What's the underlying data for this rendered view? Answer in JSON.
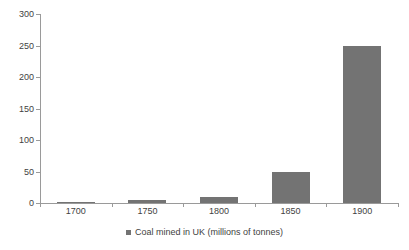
{
  "chart_data": {
    "type": "bar",
    "title": "",
    "xlabel": "",
    "ylabel": "",
    "categories": [
      "1700",
      "1750",
      "1800",
      "1850",
      "1900"
    ],
    "values": [
      2,
      4,
      10,
      50,
      250
    ],
    "series": [
      {
        "name": "Coal mined in UK (millions of tonnes)",
        "values": [
          2,
          4,
          10,
          50,
          250
        ]
      }
    ],
    "ylim": [
      0,
      300
    ],
    "ytick_step": 50,
    "yticks": [
      "0",
      "50",
      "100",
      "150",
      "200",
      "250",
      "300"
    ],
    "grid": false,
    "legend": {
      "position": "bottom",
      "entries": [
        {
          "label": "Coal mined in UK (millions of tonnes)",
          "color": "#737373",
          "marker": "legend-square-marker"
        }
      ]
    },
    "colors": {
      "bar": "#737373",
      "axis": "#9a9a9a",
      "text": "#3f3f3f",
      "background": "#ffffff"
    }
  }
}
